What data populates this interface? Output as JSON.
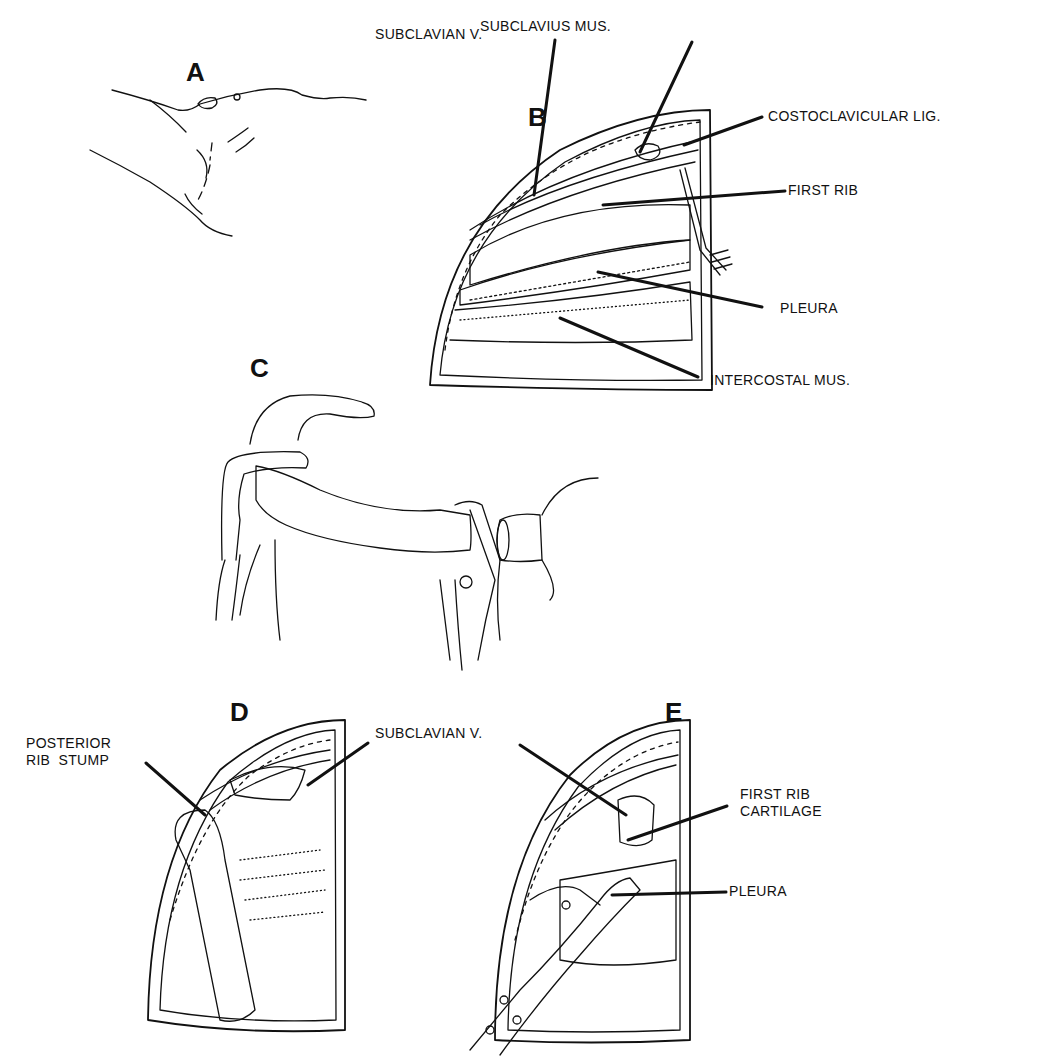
{
  "figure": {
    "panels": {
      "A": {
        "letter": "A"
      },
      "B": {
        "letter": "B",
        "labels": {
          "subclavian_v": "SUBCLAVIAN V.",
          "subclavius_mus": "SUBCLAVIUS MUS.",
          "costoclavicular_lig": "COSTOCLAVICULAR LIG.",
          "first_rib": "FIRST RIB",
          "pleura": "PLEURA",
          "intercostal_mus": "INTERCOSTAL MUS."
        }
      },
      "C": {
        "letter": "C"
      },
      "D": {
        "letter": "D",
        "labels": {
          "posterior_rib_stump": "POSTERIOR\nRIB  STUMP",
          "subclavian_v": "SUBCLAVIAN V."
        }
      },
      "E": {
        "letter": "E",
        "labels": {
          "first_rib_cartilage": "FIRST RIB\nCARTILAGE",
          "pleura": "PLEURA"
        }
      }
    },
    "colors": {
      "ink": "#111111",
      "background": "#ffffff"
    }
  }
}
